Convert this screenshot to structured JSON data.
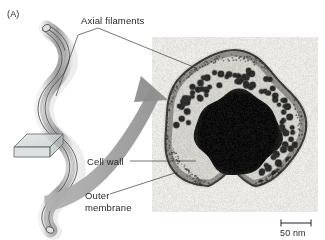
{
  "figure": {
    "panel_label": "(A)",
    "background_color": "#ffffff",
    "text_color": "#231f20"
  },
  "labels": {
    "axial_filaments": "Axial filaments",
    "cell_wall": "Cell wall",
    "outer": "Outer",
    "membrane": "membrane"
  },
  "scale_bar": {
    "value": "50 nm",
    "bar_color": "#231f20"
  },
  "diagram": {
    "organism": "spirochete-helical-cell",
    "section_plane": "cross-section-plane",
    "arrow": "magnification-arrow",
    "organism_fill": "#c9c9c9",
    "organism_outline": "#3a3a3a",
    "plane_fill": "#d6dadb",
    "arrow_color": "#9a9a9a"
  },
  "micrograph": {
    "caption_elements": [
      "outer-membrane",
      "cell-wall",
      "axial-filaments",
      "protoplasmic-cylinder"
    ],
    "panel_background": "#e8e7e4",
    "cell_fill": "#d3d1cc",
    "core_fill": "#0d0d0d",
    "filament_color": "#2a2a2a"
  },
  "leader_lines": {
    "axial_filaments_left_target": "spirochete-body",
    "axial_filaments_right_target": "filament-dots-in-micrograph",
    "cell_wall_target": "cell-wall-layer",
    "outer_membrane_target": "outer-membrane-layer"
  }
}
